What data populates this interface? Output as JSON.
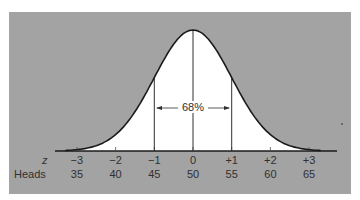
{
  "chart_data": {
    "type": "area",
    "title": "",
    "xlabel_rows": [
      "z",
      "Heads"
    ],
    "z_ticks": [
      "−3",
      "−2",
      "−1",
      "0",
      "+1",
      "+2",
      "+3"
    ],
    "heads_ticks": [
      "35",
      "40",
      "45",
      "50",
      "55",
      "60",
      "65"
    ],
    "x": [
      -3,
      -2,
      -1,
      0,
      1,
      2,
      3
    ],
    "heads": [
      35,
      40,
      45,
      50,
      55,
      60,
      65
    ],
    "vertical_lines_at_z": [
      -1,
      0,
      1
    ],
    "annotation": {
      "text": "68%",
      "from_z": -1,
      "to_z": 1
    },
    "ylim": [
      0,
      0.4
    ],
    "grid": false,
    "legend": null,
    "colors": {
      "background": "#a3a3a3",
      "curve_fill": "#ffffff",
      "curve_line": "#1a1a1a"
    }
  },
  "labels": {
    "z_row": "z",
    "heads_row": "Heads",
    "pct": "68%"
  }
}
